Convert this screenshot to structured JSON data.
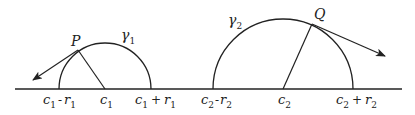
{
  "diagram": {
    "stroke_color": "#222222",
    "background": "#ffffff",
    "axis": {
      "x1": 15,
      "x2": 402,
      "y": 89
    },
    "curves": [
      {
        "name": "gamma_1",
        "label": "γ",
        "label_sub": "1",
        "center_label": "c",
        "center_sub": "1",
        "left_label": {
          "a": "c",
          "a_sub": "1",
          "op": "-",
          "b": "r",
          "b_sub": "1"
        },
        "right_label": {
          "a": "c",
          "a_sub": "1",
          "op": "+",
          "b": "r",
          "b_sub": "1"
        },
        "point_label": "P",
        "cx": 105,
        "r": 46
      },
      {
        "name": "gamma_2",
        "label": "γ",
        "label_sub": "2",
        "center_label": "c",
        "center_sub": "2",
        "left_label": {
          "a": "c",
          "a_sub": "2",
          "op": "-",
          "b": "r",
          "b_sub": "2"
        },
        "right_label": {
          "a": "c",
          "a_sub": "2",
          "op": "+",
          "b": "r",
          "b_sub": "2"
        },
        "point_label": "Q",
        "cx": 283,
        "r": 70
      }
    ]
  }
}
